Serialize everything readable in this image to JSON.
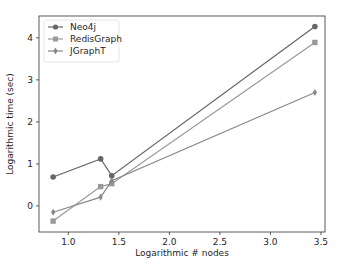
{
  "chart_data": {
    "type": "line",
    "title": "",
    "xlabel": "Logarithmic # nodes",
    "ylabel": "Logarithmic time (sec)",
    "xlim": [
      0.71,
      3.54
    ],
    "ylim": [
      -0.62,
      4.52
    ],
    "xticks": [
      1.0,
      1.5,
      2.0,
      2.5,
      3.0,
      3.5
    ],
    "xtick_labels": [
      "1.0",
      "1.5",
      "2.0",
      "2.5",
      "3.0",
      "3.5"
    ],
    "yticks": [
      0,
      1,
      2,
      3,
      4
    ],
    "ytick_labels": [
      "0",
      "1",
      "2",
      "3",
      "4"
    ],
    "grid": false,
    "legend_position": "upper left",
    "x": [
      0.85,
      1.32,
      1.43,
      3.44
    ],
    "series": [
      {
        "name": "Neo4j",
        "marker": "circle",
        "color": "#666666",
        "values": [
          0.69,
          1.12,
          0.72,
          4.27
        ]
      },
      {
        "name": "RedisGraph",
        "marker": "square",
        "color": "#999999",
        "values": [
          -0.36,
          0.46,
          0.53,
          3.89
        ]
      },
      {
        "name": "JGraphT",
        "marker": "diamond",
        "color": "#888888",
        "values": [
          -0.15,
          0.21,
          0.6,
          2.7
        ]
      }
    ]
  },
  "legend": {
    "items": [
      "Neo4j",
      "RedisGraph",
      "JGraphT"
    ]
  }
}
